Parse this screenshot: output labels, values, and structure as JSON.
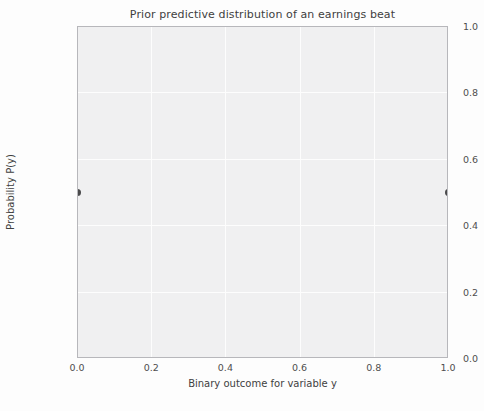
{
  "chart_data": {
    "type": "scatter",
    "title": "Prior predictive distribution of an earnings beat",
    "xlabel": "Binary outcome for variable y",
    "ylabel": "Probability P(y)",
    "x": [
      0.0,
      1.0
    ],
    "values": [
      0.5,
      0.5
    ],
    "xlim": [
      0.0,
      1.0
    ],
    "ylim": [
      0.0,
      1.0
    ],
    "xticks": [
      "0.0",
      "0.2",
      "0.4",
      "0.6",
      "0.8",
      "1.0"
    ],
    "xtick_values": [
      0.0,
      0.2,
      0.4,
      0.6,
      0.8,
      1.0
    ],
    "yticks": [
      "0.0",
      "0.2",
      "0.4",
      "0.6",
      "0.8",
      "1.0"
    ],
    "ytick_values": [
      0.0,
      0.2,
      0.4,
      0.6,
      0.8,
      1.0
    ],
    "grid": true,
    "legend": null,
    "series": [
      {
        "name": "P(y)",
        "categories": [
          "0.0",
          "1.0"
        ],
        "values": [
          0.5,
          0.5
        ]
      }
    ],
    "colors": {
      "marker": "#4a4a4c",
      "stem": "#4d4d4f",
      "plot_background": "#f2f2f3",
      "gridline": "#ffffff",
      "spine": "#b9b9bd",
      "text": "#3f3f3f"
    }
  }
}
